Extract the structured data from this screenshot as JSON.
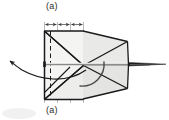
{
  "figure": {
    "kind": "technical-line-drawing",
    "background_color": "#ffffff",
    "fill_color": "#e8e8e6",
    "fill_color_light": "#f2f2f0",
    "stroke_color": "#1a1a1a",
    "grid_color": "#9a9a9a",
    "mid_line_color": "#8c8c8c",
    "labels": {
      "top": "(a)",
      "bottom": "(a)"
    },
    "dimension": {
      "segments": 3,
      "tick_count": 4,
      "arrowheads": "double-ended per segment",
      "y": 24
    },
    "grid_lines_x": [
      44,
      57,
      70,
      83
    ],
    "body": {
      "left_box": {
        "x1": 44,
        "y1": 31,
        "x2": 83,
        "y2": 99
      },
      "diagonals": "X cross between box corners",
      "kite_apex_x": 128,
      "tail_tip_x": 166,
      "center_x": 83,
      "center_y": 65
    },
    "callout_arrow": {
      "from_x": 83,
      "from_y": 65,
      "to_x": 8,
      "to_y": 62,
      "style": "curved, single arrowhead"
    },
    "rotation_arc": {
      "cx": 83,
      "cy": 65,
      "r": 22,
      "style": "quarter arc, open"
    }
  }
}
